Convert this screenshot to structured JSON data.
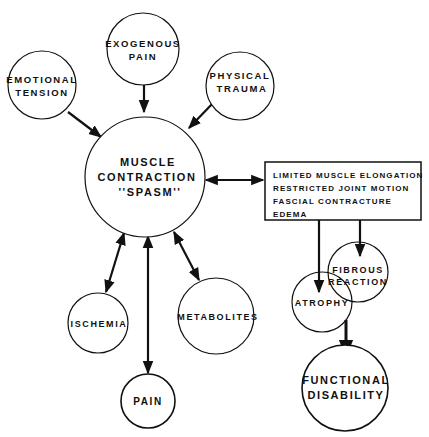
{
  "diagram": {
    "nodes": {
      "emotional_tension": {
        "line1": "EMOTIONAL",
        "line2": "TENSION"
      },
      "exogenous_pain": {
        "line1": "EXOGENOUS",
        "line2": "PAIN"
      },
      "physical_trauma": {
        "line1": "PHYSICAL",
        "line2": "TRAUMA"
      },
      "muscle_contraction": {
        "line1": "MUSCLE",
        "line2": "CONTRACTION",
        "line3": "''SPASM''"
      },
      "ischemia": {
        "line1": "ISCHEMIA"
      },
      "metabolites": {
        "line1": "METABOLITES"
      },
      "pain": {
        "line1": "PAIN"
      },
      "fibrous_reaction": {
        "line1": "FIBROUS",
        "line2": "REACTION"
      },
      "atrophy": {
        "line1": "ATROPHY"
      },
      "functional_disability": {
        "line1": "FUNCTIONAL",
        "line2": "DISABILITY"
      }
    },
    "effects_box": {
      "items": [
        "LIMITED MUSCLE ELONGATION",
        "RESTRICTED JOINT MOTION",
        "FASCIAL CONTRACTURE",
        "EDEMA"
      ]
    },
    "edges": [
      {
        "from": "emotional_tension",
        "to": "muscle_contraction",
        "type": "one-way"
      },
      {
        "from": "exogenous_pain",
        "to": "muscle_contraction",
        "type": "one-way"
      },
      {
        "from": "physical_trauma",
        "to": "muscle_contraction",
        "type": "one-way"
      },
      {
        "from": "muscle_contraction",
        "to": "effects_box",
        "type": "two-way"
      },
      {
        "from": "muscle_contraction",
        "to": "ischemia",
        "type": "two-way"
      },
      {
        "from": "muscle_contraction",
        "to": "pain",
        "type": "two-way"
      },
      {
        "from": "muscle_contraction",
        "to": "metabolites",
        "type": "two-way"
      },
      {
        "from": "effects_box",
        "to": "atrophy",
        "type": "one-way"
      },
      {
        "from": "effects_box",
        "to": "fibrous_reaction",
        "type": "one-way"
      },
      {
        "from": "atrophy",
        "to": "functional_disability",
        "type": "one-way"
      }
    ],
    "colors": {
      "stroke": "#111111",
      "background": "#ffffff"
    }
  }
}
